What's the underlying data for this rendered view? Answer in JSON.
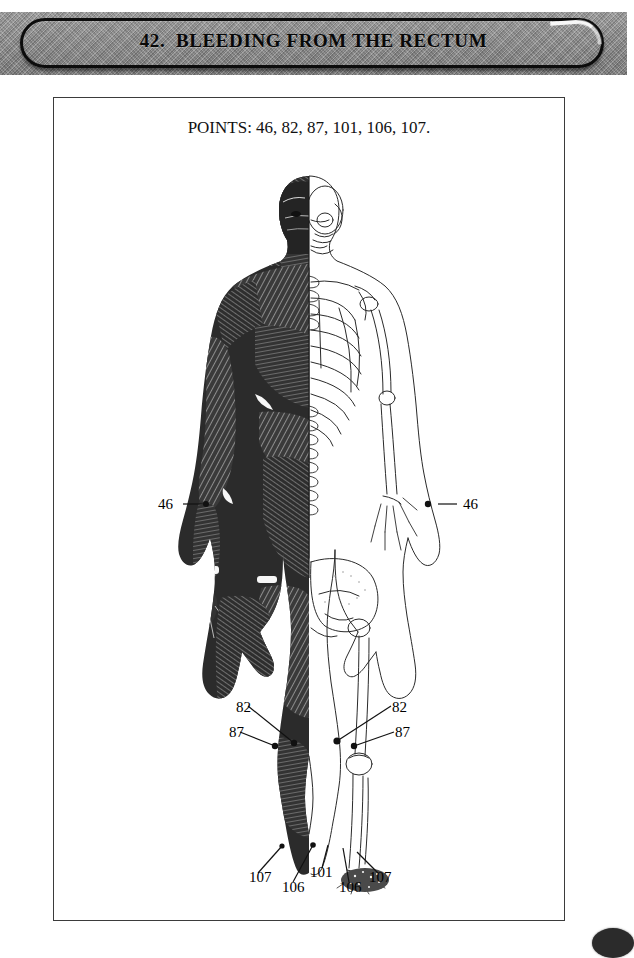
{
  "header": {
    "title": "42.  BLEEDING FROM THE RECTUM",
    "banner_color": "#8e8e8e",
    "outline_color": "#0c0c0c"
  },
  "content": {
    "points_line": "POINTS: 46, 82, 87, 101, 106, 107.",
    "frame_border_color": "#3b3b3b"
  },
  "figure": {
    "callouts": [
      {
        "id": "left-46",
        "label": "46",
        "x": 157,
        "y": 495,
        "dot_x": 224,
        "dot_y": 503
      },
      {
        "id": "right-46",
        "label": "46",
        "x": 462,
        "y": 495,
        "dot_x": 427,
        "dot_y": 503
      },
      {
        "id": "left-82",
        "label": "82",
        "x": 235,
        "y": 704,
        "dot_x": 293,
        "dot_y": 742
      },
      {
        "id": "left-87",
        "label": "87",
        "x": 228,
        "y": 727,
        "dot_x": 274,
        "dot_y": 745
      },
      {
        "id": "right-82",
        "label": "82",
        "x": 391,
        "y": 704,
        "dot_x": 334,
        "dot_y": 740
      },
      {
        "id": "right-87",
        "label": "87",
        "x": 394,
        "y": 727,
        "dot_x": 352,
        "dot_y": 745
      },
      {
        "id": "left-107",
        "label": "107",
        "x": 248,
        "y": 874,
        "dot_x": 281,
        "dot_y": 848
      },
      {
        "id": "left-106",
        "label": "106",
        "x": 281,
        "y": 884,
        "dot_x": 311,
        "dot_y": 844
      },
      {
        "id": "center-101",
        "label": "101",
        "x": 309,
        "y": 871,
        "dot_x": 325,
        "dot_y": 842
      },
      {
        "id": "right-106",
        "label": "106",
        "x": 338,
        "y": 884,
        "dot_x": 343,
        "dot_y": 848
      },
      {
        "id": "right-107",
        "label": "107",
        "x": 368,
        "y": 874,
        "dot_x": 352,
        "dot_y": 852
      }
    ],
    "point_numbers": [
      "46",
      "82",
      "87",
      "101",
      "106",
      "107"
    ]
  },
  "page_marker": {
    "shape": "filled-ellipse",
    "color": "#2b2b2b"
  }
}
